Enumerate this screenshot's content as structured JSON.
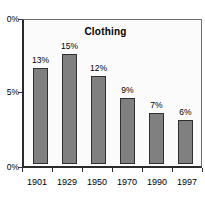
{
  "chart_data": {
    "type": "bar",
    "title": "Clothing",
    "xlabel": "",
    "ylabel": "",
    "categories": [
      "1901",
      "1929",
      "1950",
      "1970",
      "1990",
      "1997"
    ],
    "values": [
      13,
      15,
      12,
      9,
      7,
      6
    ],
    "value_labels": [
      "13%",
      "15%",
      "12%",
      "9%",
      "7%",
      "6%"
    ],
    "ytick_labels": [
      "0%",
      "5%",
      "0%"
    ],
    "ytick_values": [
      10,
      5,
      0
    ],
    "ylim": [
      0,
      20
    ],
    "grid": false,
    "legend": "none",
    "bar_color": "#808080",
    "bar_edge_color": "#2f2f2f",
    "axis_color": "#2b2b2b",
    "plot_background": "#fbfbfb",
    "figure_background": "#ffffff"
  }
}
